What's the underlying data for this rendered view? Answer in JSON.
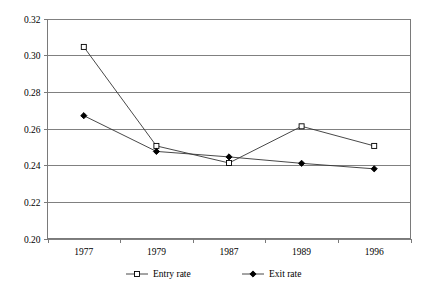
{
  "chart_data": {
    "type": "line",
    "title": "",
    "subtitle": "",
    "xlabel": "",
    "ylabel": "",
    "categories": [
      "1977",
      "1979",
      "1987",
      "1989",
      "1996"
    ],
    "ylim": [
      0.2,
      0.32
    ],
    "ytick_labels": [
      "0.32",
      "0.30",
      "0.28",
      "0.26",
      "0.24",
      "0.22",
      "0.20"
    ],
    "ytick_values": [
      0.32,
      0.3,
      0.28,
      0.26,
      0.24,
      0.22,
      0.2
    ],
    "grid": "horizontal",
    "legend_position": "bottom",
    "series": [
      {
        "name": "Entry rate",
        "marker": "open-square",
        "values": [
          0.3045,
          0.2505,
          0.2412,
          0.2612,
          0.2505
        ]
      },
      {
        "name": "Exit rate",
        "marker": "filled-diamond",
        "values": [
          0.267,
          0.2475,
          0.2445,
          0.241,
          0.238
        ]
      }
    ]
  },
  "legend": {
    "items": [
      {
        "label": "Entry rate",
        "marker": "open-square"
      },
      {
        "label": "Exit rate",
        "marker": "filled-diamond"
      }
    ]
  },
  "colors": {
    "grid": "#808080",
    "axis": "#7a7a7a",
    "series_line": "#333333",
    "marker_fill_open": "#ffffff",
    "marker_fill_closed": "#000000",
    "background": "#ffffff"
  }
}
